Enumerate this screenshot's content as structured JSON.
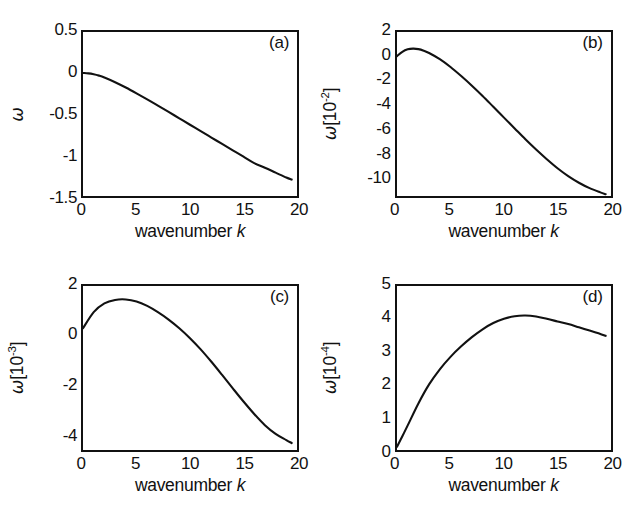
{
  "figure": {
    "background_color": "#ffffff",
    "line_color": "#111111",
    "panel_count": 4
  },
  "chart_data": [
    {
      "type": "line",
      "panel": "(a)",
      "title": "",
      "xlabel": "wavenumber k",
      "ylabel": "ω",
      "ylabel_exponent": "",
      "xlim": [
        0,
        20
      ],
      "ylim": [
        -1.5,
        0.5
      ],
      "xticks": [
        "0",
        "5",
        "10",
        "15",
        "20"
      ],
      "xtick_values": [
        0,
        5,
        10,
        15,
        20
      ],
      "yticks": [
        "0.5",
        "0",
        "-0.5",
        "-1",
        "-1.5"
      ],
      "ytick_values": [
        0.5,
        0,
        -0.5,
        -1,
        -1.5
      ],
      "grid": false,
      "legend": "none",
      "x": [
        0,
        0.5,
        1,
        1.5,
        2,
        3,
        4,
        5,
        6,
        7,
        8,
        9,
        10,
        11,
        12,
        13,
        14,
        15,
        16,
        17,
        18,
        19,
        19.5
      ],
      "values": [
        0.0,
        -0.004,
        -0.015,
        -0.032,
        -0.055,
        -0.112,
        -0.177,
        -0.248,
        -0.322,
        -0.398,
        -0.475,
        -0.553,
        -0.631,
        -0.709,
        -0.787,
        -0.865,
        -0.943,
        -1.021,
        -1.099,
        -1.155,
        -1.215,
        -1.275,
        -1.3
      ]
    },
    {
      "type": "line",
      "panel": "(b)",
      "title": "",
      "xlabel": "wavenumber k",
      "ylabel": "ω",
      "ylabel_exponent": "-2",
      "xlim": [
        0,
        20
      ],
      "ylim": [
        -11.6,
        2
      ],
      "xticks": [
        "0",
        "5",
        "10",
        "15",
        "20"
      ],
      "xtick_values": [
        0,
        5,
        10,
        15,
        20
      ],
      "yticks": [
        "2",
        "0",
        "-2",
        "-4",
        "-6",
        "-8",
        "-10"
      ],
      "ytick_values": [
        2,
        0,
        -2,
        -4,
        -6,
        -8,
        -10
      ],
      "grid": false,
      "legend": "none",
      "x": [
        0,
        0.5,
        1,
        1.5,
        2,
        2.5,
        3,
        4,
        5,
        6,
        7,
        8,
        9,
        10,
        11,
        12,
        13,
        14,
        15,
        16,
        17,
        18,
        19,
        19.5
      ],
      "values": [
        0.0,
        0.36,
        0.56,
        0.62,
        0.58,
        0.45,
        0.26,
        -0.25,
        -0.9,
        -1.65,
        -2.45,
        -3.3,
        -4.2,
        -5.1,
        -6.0,
        -6.9,
        -7.75,
        -8.55,
        -9.3,
        -9.95,
        -10.5,
        -10.95,
        -11.3,
        -11.45
      ]
    },
    {
      "type": "line",
      "panel": "(c)",
      "title": "",
      "xlabel": "wavenumber k",
      "ylabel": "ω",
      "ylabel_exponent": "-3",
      "xlim": [
        0,
        20
      ],
      "ylim": [
        -4.6,
        2
      ],
      "xticks": [
        "0",
        "5",
        "10",
        "15",
        "20"
      ],
      "xtick_values": [
        0,
        5,
        10,
        15,
        20
      ],
      "yticks": [
        "2",
        "0",
        "-2",
        "-4"
      ],
      "ytick_values": [
        2,
        0,
        -2,
        -4
      ],
      "grid": false,
      "legend": "none",
      "x": [
        0,
        1,
        2,
        3,
        4,
        5,
        6,
        7,
        8,
        9,
        10,
        11,
        12,
        13,
        14,
        15,
        16,
        17,
        18,
        19,
        19.5
      ],
      "values": [
        0.3,
        0.95,
        1.3,
        1.44,
        1.46,
        1.38,
        1.2,
        0.95,
        0.65,
        0.3,
        -0.1,
        -0.55,
        -1.05,
        -1.58,
        -2.12,
        -2.65,
        -3.15,
        -3.6,
        -3.95,
        -4.2,
        -4.32
      ]
    },
    {
      "type": "line",
      "panel": "(d)",
      "title": "",
      "xlabel": "wavenumber k",
      "ylabel": "ω",
      "ylabel_exponent": "-4",
      "xlim": [
        0,
        20
      ],
      "ylim": [
        0,
        5
      ],
      "xticks": [
        "0",
        "5",
        "10",
        "15",
        "20"
      ],
      "xtick_values": [
        0,
        5,
        10,
        15,
        20
      ],
      "yticks": [
        "5",
        "4",
        "3",
        "2",
        "1",
        "0"
      ],
      "ytick_values": [
        5,
        4,
        3,
        2,
        1,
        0
      ],
      "grid": false,
      "legend": "none",
      "x": [
        0,
        0.5,
        1,
        2,
        3,
        4,
        5,
        6,
        7,
        8,
        9,
        10,
        11,
        12,
        13,
        14,
        15,
        16,
        17,
        18,
        19,
        19.5
      ],
      "values": [
        0.1,
        0.42,
        0.75,
        1.42,
        2.0,
        2.46,
        2.84,
        3.16,
        3.44,
        3.68,
        3.87,
        4.0,
        4.08,
        4.1,
        4.07,
        4.0,
        3.92,
        3.84,
        3.74,
        3.64,
        3.54,
        3.48
      ]
    }
  ],
  "panels": [
    {
      "id": "a",
      "tag": "(a)",
      "xaxis_title_prefix": "wavenumber ",
      "xaxis_title_var": "k",
      "yaxis_symbol": "ω",
      "yaxis_unit_open": "[10",
      "yaxis_unit_exp": "",
      "yaxis_unit_close": ""
    },
    {
      "id": "b",
      "tag": "(b)",
      "xaxis_title_prefix": "wavenumber ",
      "xaxis_title_var": "k",
      "yaxis_symbol": "ω",
      "yaxis_unit_open": "[10",
      "yaxis_unit_exp": "-2",
      "yaxis_unit_close": "]"
    },
    {
      "id": "c",
      "tag": "(c)",
      "xaxis_title_prefix": "wavenumber ",
      "xaxis_title_var": "k",
      "yaxis_symbol": "ω",
      "yaxis_unit_open": "[10",
      "yaxis_unit_exp": "-3",
      "yaxis_unit_close": "]"
    },
    {
      "id": "d",
      "tag": "(d)",
      "xaxis_title_prefix": "wavenumber ",
      "xaxis_title_var": "k",
      "yaxis_symbol": "ω",
      "yaxis_unit_open": "[10",
      "yaxis_unit_exp": "-4",
      "yaxis_unit_close": "]"
    }
  ]
}
